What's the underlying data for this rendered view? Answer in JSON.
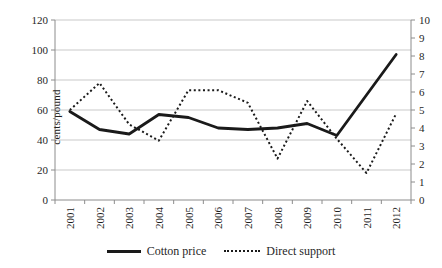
{
  "chart_data": {
    "type": "line",
    "x": [
      "2001",
      "2002",
      "2003",
      "2004",
      "2005",
      "2006",
      "2007",
      "2008",
      "2009",
      "2010",
      "2011",
      "2012"
    ],
    "series": [
      {
        "name": "Cotton price",
        "axis": "left",
        "style": "solid",
        "values": [
          59,
          47,
          44,
          57,
          55,
          48,
          47,
          48,
          51,
          43,
          70,
          97
        ]
      },
      {
        "name": "Direct support",
        "axis": "right",
        "style": "dotted",
        "values": [
          5.0,
          6.5,
          4.2,
          3.3,
          6.1,
          6.1,
          5.4,
          2.3,
          5.5,
          3.4,
          1.5,
          4.8
        ]
      }
    ],
    "left_axis": {
      "label": "cents/pound",
      "min": 0,
      "max": 120,
      "step": 20
    },
    "right_axis": {
      "label": "",
      "min": 0,
      "max": 10,
      "step": 1
    },
    "grid": true,
    "legend_position": "bottom",
    "title": ""
  },
  "colors": {
    "line": "#1a1a1a",
    "grid": "#c9c9c9",
    "axis": "#8c8c8c",
    "text": "#1f1f1f",
    "background": "#ffffff"
  }
}
